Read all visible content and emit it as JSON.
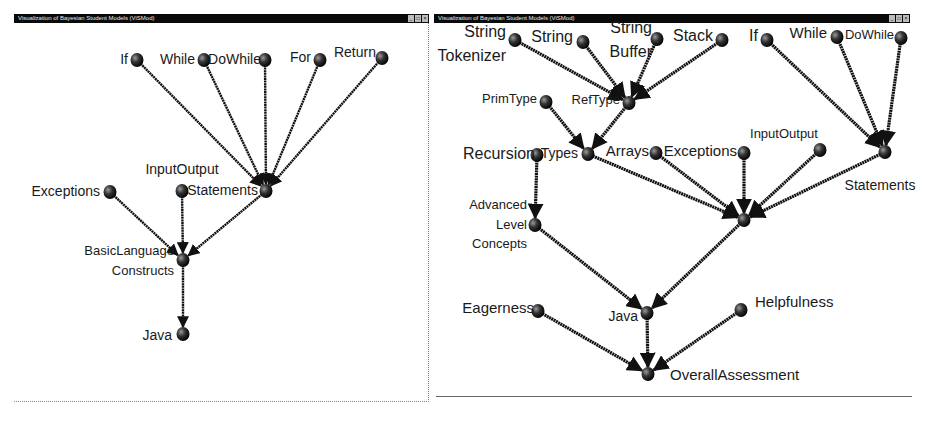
{
  "left_window": {
    "title": "Visualization of Bayesian Student Models (ViSMod)",
    "buttons": [
      "minimize",
      "maximize",
      "close"
    ],
    "nodes": [
      {
        "id": "if",
        "label": "If",
        "x": 137,
        "y": 60
      },
      {
        "id": "while",
        "label": "While",
        "x": 204,
        "y": 60
      },
      {
        "id": "dowhile",
        "label": "DoWhile",
        "x": 265,
        "y": 60
      },
      {
        "id": "for",
        "label": "For",
        "x": 320,
        "y": 60
      },
      {
        "id": "return",
        "label": "Return",
        "x": 382,
        "y": 58
      },
      {
        "id": "exceptions",
        "label": "Exceptions",
        "x": 110,
        "y": 192
      },
      {
        "id": "inputoutput",
        "label": "InputOutput",
        "x": 182,
        "y": 191
      },
      {
        "id": "statements",
        "label": "Statements",
        "x": 266,
        "y": 191
      },
      {
        "id": "basiclanguage",
        "label": "BasicLanguage Constructs",
        "x": 183,
        "y": 260
      },
      {
        "id": "java",
        "label": "Java",
        "x": 183,
        "y": 334
      }
    ],
    "edges": [
      [
        "if",
        "statements"
      ],
      [
        "while",
        "statements"
      ],
      [
        "dowhile",
        "statements"
      ],
      [
        "for",
        "statements"
      ],
      [
        "return",
        "statements"
      ],
      [
        "exceptions",
        "basiclanguage"
      ],
      [
        "inputoutput",
        "basiclanguage"
      ],
      [
        "statements",
        "basiclanguage"
      ],
      [
        "basiclanguage",
        "java"
      ]
    ]
  },
  "right_window": {
    "title": "Visualization of Bayesian Student Models (ViSMod)",
    "buttons": [
      "minimize",
      "maximize",
      "close"
    ],
    "nodes": [
      {
        "id": "stringtokenizer",
        "label": "String Tokenizer",
        "x": 515,
        "y": 40
      },
      {
        "id": "string",
        "label": "String",
        "x": 583,
        "y": 42
      },
      {
        "id": "stringbuffer",
        "label": "String Buffer",
        "x": 657,
        "y": 39
      },
      {
        "id": "stack",
        "label": "Stack",
        "x": 722,
        "y": 40
      },
      {
        "id": "if",
        "label": "If",
        "x": 767,
        "y": 40
      },
      {
        "id": "while",
        "label": "While",
        "x": 837,
        "y": 37
      },
      {
        "id": "dowhile",
        "label": "DoWhile",
        "x": 901,
        "y": 38
      },
      {
        "id": "primtype",
        "label": "PrimType",
        "x": 546,
        "y": 102
      },
      {
        "id": "reftype",
        "label": "RefType",
        "x": 629,
        "y": 103
      },
      {
        "id": "recursion",
        "label": "Recursion",
        "x": 537,
        "y": 155
      },
      {
        "id": "types",
        "label": "Types",
        "x": 588,
        "y": 154
      },
      {
        "id": "arrays",
        "label": "Arrays",
        "x": 656,
        "y": 153
      },
      {
        "id": "exceptions",
        "label": "Exceptions",
        "x": 744,
        "y": 153
      },
      {
        "id": "inputoutput",
        "label": "InputOutput",
        "x": 820,
        "y": 150
      },
      {
        "id": "statements",
        "label": "Statements",
        "x": 885,
        "y": 152
      },
      {
        "id": "advanced",
        "label": "Advanced Level Concepts",
        "x": 535,
        "y": 225
      },
      {
        "id": "hub",
        "label": "",
        "x": 744,
        "y": 220
      },
      {
        "id": "java",
        "label": "Java",
        "x": 647,
        "y": 313
      },
      {
        "id": "eagerness",
        "label": "Eagerness",
        "x": 538,
        "y": 311
      },
      {
        "id": "helpfulness",
        "label": "Helpfulness",
        "x": 741,
        "y": 310
      },
      {
        "id": "overall",
        "label": "OverallAssessment",
        "x": 648,
        "y": 374
      }
    ],
    "edges": [
      [
        "stringtokenizer",
        "reftype"
      ],
      [
        "string",
        "reftype"
      ],
      [
        "stringbuffer",
        "reftype"
      ],
      [
        "stack",
        "reftype"
      ],
      [
        "if",
        "statements"
      ],
      [
        "while",
        "statements"
      ],
      [
        "dowhile",
        "statements"
      ],
      [
        "primtype",
        "types"
      ],
      [
        "reftype",
        "types"
      ],
      [
        "recursion",
        "advanced"
      ],
      [
        "types",
        "hub"
      ],
      [
        "arrays",
        "hub"
      ],
      [
        "exceptions",
        "hub"
      ],
      [
        "inputoutput",
        "hub"
      ],
      [
        "statements",
        "hub"
      ],
      [
        "advanced",
        "java"
      ],
      [
        "hub",
        "java"
      ],
      [
        "java",
        "overall"
      ],
      [
        "eagerness",
        "overall"
      ],
      [
        "helpfulness",
        "overall"
      ]
    ]
  },
  "colors": {
    "titlebar": "#0a0a0a",
    "edge": "#111111",
    "node": "#111111",
    "text": "#1a1a1a",
    "background": "#ffffff"
  }
}
